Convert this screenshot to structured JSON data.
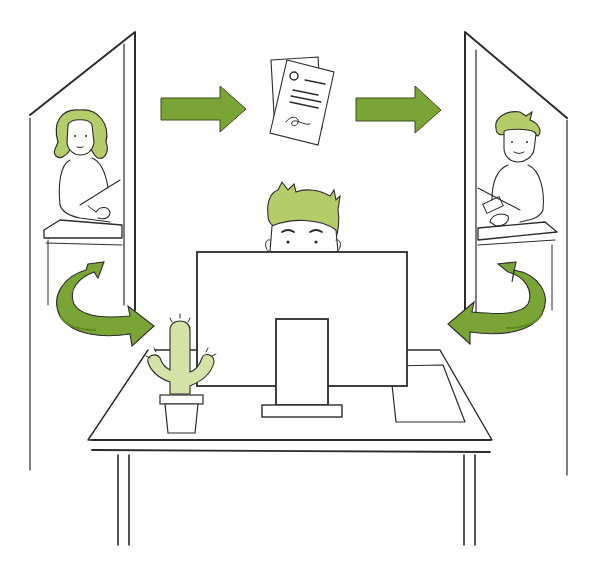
{
  "illustration": {
    "description": "Workflow illustration: two remote workers in side panels exchange a document via arrows; a central worker peeks over a monitor at a desk with a cactus",
    "width": 596,
    "height": 567
  },
  "colors": {
    "background": "#ffffff",
    "ink": "#2b2b2b",
    "arrow_green": "#7aa536",
    "arrow_green_dark": "#5e8a22",
    "hair_green": "#b5cc6a",
    "cactus_green": "#d6e3a8"
  },
  "elements": {
    "left_panel": {
      "person": "woman-writing",
      "hair_color": "green"
    },
    "right_panel": {
      "person": "man-typing",
      "hair_color": "green"
    },
    "center": {
      "person": "man-peeking-over-monitor",
      "objects": [
        "monitor",
        "desk",
        "cactus-pot",
        "paper-sheet"
      ]
    },
    "document": {
      "icon": "document-stack-icon"
    },
    "arrows": [
      {
        "id": "arrow-left-to-document",
        "direction": "right"
      },
      {
        "id": "arrow-document-to-right",
        "direction": "right"
      },
      {
        "id": "curved-arrow-left-to-center",
        "direction": "right"
      },
      {
        "id": "curved-arrow-right-to-center",
        "direction": "left"
      }
    ]
  }
}
